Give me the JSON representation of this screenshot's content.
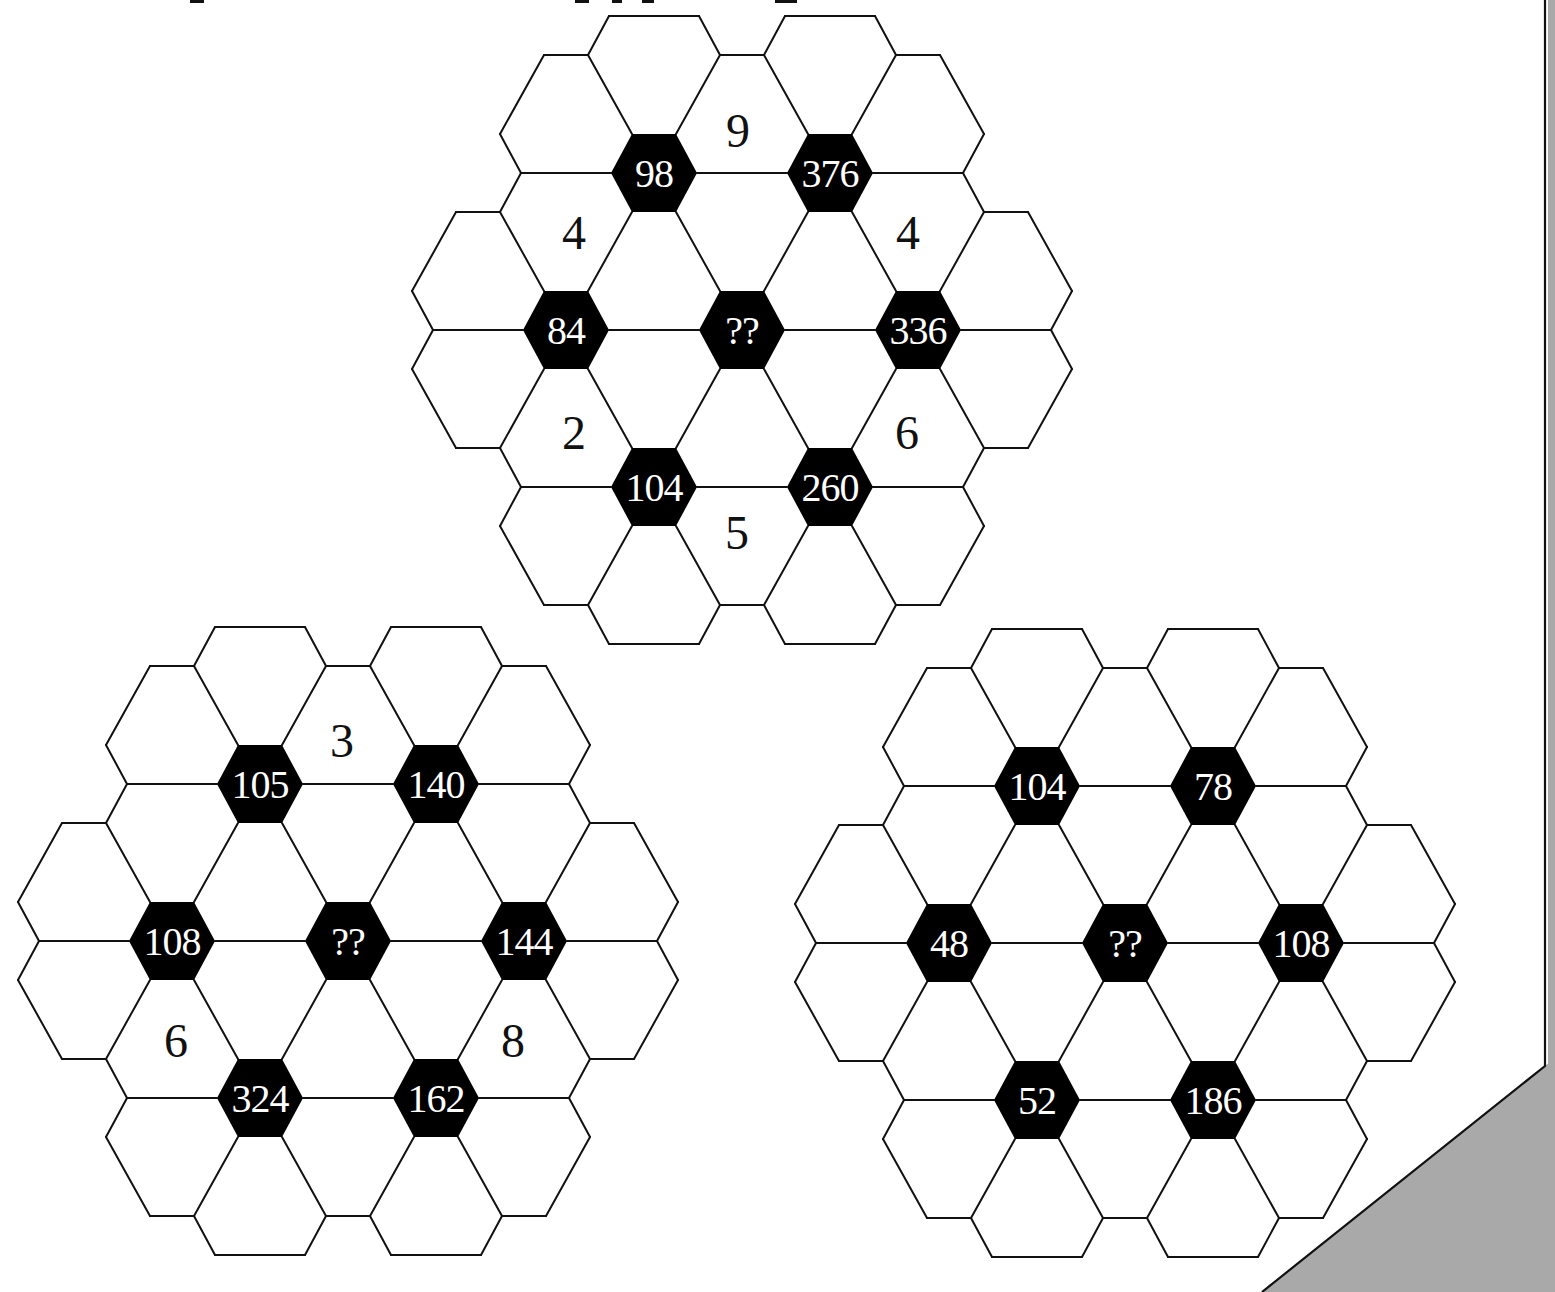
{
  "page": {
    "title_fragment_marks": [
      {
        "x": 190,
        "w": 14
      },
      {
        "x": 575,
        "w": 14
      },
      {
        "x": 612,
        "w": 10
      },
      {
        "x": 642,
        "w": 12
      },
      {
        "x": 775,
        "w": 22
      }
    ],
    "colors": {
      "background": "#ffffff",
      "line": "#111111",
      "node_fill": "#000000",
      "node_text": "#ffffff",
      "cell_text": "#111111",
      "page_curl": "#a9a9a9"
    }
  },
  "geometry": {
    "col_step": 88,
    "row_step": 157,
    "node_half_width": 43,
    "node_half_edge": 22,
    "node_half_height": 39
  },
  "puzzles": [
    {
      "id": "top",
      "origin": [
        654,
        173
      ],
      "nodes": [
        {
          "col": 0,
          "row": 0,
          "label": "98"
        },
        {
          "col": 2,
          "row": 0,
          "label": "376"
        },
        {
          "col": -1,
          "row": 1,
          "label": "84"
        },
        {
          "col": 1,
          "row": 1,
          "label": "??"
        },
        {
          "col": 3,
          "row": 1,
          "label": "336"
        },
        {
          "col": 0,
          "row": 2,
          "label": "104"
        },
        {
          "col": 2,
          "row": 2,
          "label": "260"
        }
      ],
      "cells": [
        {
          "dx": 84,
          "dy": -43,
          "label": "9"
        },
        {
          "dx": -80,
          "dy": 59,
          "label": "4"
        },
        {
          "dx": 254,
          "dy": 59,
          "label": "4"
        },
        {
          "dx": -80,
          "dy": 259,
          "label": "2"
        },
        {
          "dx": 253,
          "dy": 259,
          "label": "6"
        },
        {
          "dx": 83,
          "dy": 359,
          "label": "5"
        }
      ]
    },
    {
      "id": "bottom-left",
      "origin": [
        260,
        784
      ],
      "nodes": [
        {
          "col": 0,
          "row": 0,
          "label": "105"
        },
        {
          "col": 2,
          "row": 0,
          "label": "140"
        },
        {
          "col": -1,
          "row": 1,
          "label": "108"
        },
        {
          "col": 1,
          "row": 1,
          "label": "??"
        },
        {
          "col": 3,
          "row": 1,
          "label": "144"
        },
        {
          "col": 0,
          "row": 2,
          "label": "324"
        },
        {
          "col": 2,
          "row": 2,
          "label": "162"
        }
      ],
      "cells": [
        {
          "dx": 82,
          "dy": -44,
          "label": "3"
        },
        {
          "dx": -84,
          "dy": 256,
          "label": "6"
        },
        {
          "dx": 253,
          "dy": 256,
          "label": "8"
        }
      ]
    },
    {
      "id": "bottom-right",
      "origin": [
        1037,
        786
      ],
      "nodes": [
        {
          "col": 0,
          "row": 0,
          "label": "104"
        },
        {
          "col": 2,
          "row": 0,
          "label": "78"
        },
        {
          "col": -1,
          "row": 1,
          "label": "48"
        },
        {
          "col": 1,
          "row": 1,
          "label": "??"
        },
        {
          "col": 3,
          "row": 1,
          "label": "108"
        },
        {
          "col": 0,
          "row": 2,
          "label": "52"
        },
        {
          "col": 2,
          "row": 2,
          "label": "186"
        }
      ],
      "cells": []
    }
  ]
}
